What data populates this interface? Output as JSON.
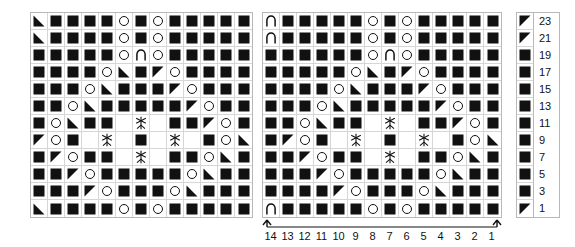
{
  "legend_icons": {
    "knit": "filled-square-icon",
    "yarnover": "open-circle-icon",
    "dec_left": "left-leaning-triangle-icon",
    "dec_right": "right-leaning-triangle-icon",
    "arch": "arch-icon",
    "cluster": "cluster-star-icon",
    "blank": "empty-cell"
  },
  "colors": {
    "symbol": "#111111",
    "grid_line": "#d6d6d6",
    "border": "#b8b8b8",
    "background": "#ffffff"
  },
  "row_numbers": [
    "23",
    "21",
    "19",
    "17",
    "15",
    "13",
    "11",
    "9",
    "7",
    "5",
    "3",
    "1"
  ],
  "row_legend_symbols": [
    "dec_left",
    "dec_left",
    "knit",
    "knit",
    "knit",
    "knit",
    "knit",
    "knit",
    "knit",
    "knit",
    "knit",
    "dec_left"
  ],
  "column_numbers": [
    "14",
    "13",
    "12",
    "11",
    "10",
    "9",
    "8",
    "7",
    "6",
    "5",
    "4",
    "3",
    "2",
    "1"
  ],
  "repeat_bracket": {
    "label": "",
    "left_arrow": "up-arrow-icon",
    "right_arrow": "up-arrow-icon"
  },
  "left_chart": {
    "name": "left pattern repeat",
    "columns": 13,
    "rows": [
      [
        "dec_right",
        "knit",
        "knit",
        "knit",
        "knit",
        "yarnover",
        "knit",
        "yarnover",
        "knit",
        "knit",
        "knit",
        "knit",
        "knit"
      ],
      [
        "dec_right",
        "knit",
        "knit",
        "knit",
        "knit",
        "yarnover",
        "knit",
        "yarnover",
        "knit",
        "knit",
        "knit",
        "knit",
        "knit"
      ],
      [
        "knit",
        "knit",
        "knit",
        "knit",
        "knit",
        "yarnover",
        "arch",
        "yarnover",
        "knit",
        "knit",
        "knit",
        "knit",
        "knit"
      ],
      [
        "knit",
        "knit",
        "knit",
        "knit",
        "yarnover",
        "dec_right",
        "knit",
        "dec_left",
        "yarnover",
        "knit",
        "knit",
        "knit",
        "knit"
      ],
      [
        "knit",
        "knit",
        "knit",
        "yarnover",
        "dec_right",
        "knit",
        "knit",
        "knit",
        "dec_left",
        "yarnover",
        "knit",
        "knit",
        "knit"
      ],
      [
        "knit",
        "knit",
        "yarnover",
        "dec_right",
        "knit",
        "knit",
        "knit",
        "knit",
        "knit",
        "dec_left",
        "yarnover",
        "knit",
        "knit"
      ],
      [
        "knit",
        "yarnover",
        "dec_right",
        "knit",
        "knit",
        "blank",
        "cluster",
        "blank",
        "knit",
        "knit",
        "dec_left",
        "yarnover",
        "knit"
      ],
      [
        "dec_left",
        "yarnover",
        "knit",
        "blank",
        "cluster",
        "blank",
        "knit",
        "blank",
        "cluster",
        "blank",
        "knit",
        "yarnover",
        "dec_right"
      ],
      [
        "knit",
        "dec_left",
        "yarnover",
        "knit",
        "knit",
        "blank",
        "cluster",
        "blank",
        "knit",
        "knit",
        "yarnover",
        "dec_right",
        "knit"
      ],
      [
        "knit",
        "knit",
        "dec_left",
        "yarnover",
        "knit",
        "knit",
        "knit",
        "knit",
        "knit",
        "yarnover",
        "dec_right",
        "knit",
        "knit"
      ],
      [
        "knit",
        "knit",
        "knit",
        "dec_left",
        "yarnover",
        "knit",
        "knit",
        "knit",
        "yarnover",
        "dec_right",
        "knit",
        "knit",
        "knit"
      ],
      [
        "dec_right",
        "knit",
        "knit",
        "knit",
        "knit",
        "yarnover",
        "knit",
        "yarnover",
        "knit",
        "knit",
        "knit",
        "knit",
        "knit"
      ]
    ]
  },
  "right_chart": {
    "name": "right pattern repeat",
    "columns": 14,
    "rows": [
      [
        "arch",
        "knit",
        "knit",
        "knit",
        "knit",
        "knit",
        "yarnover",
        "knit",
        "yarnover",
        "knit",
        "knit",
        "knit",
        "knit",
        "knit"
      ],
      [
        "arch",
        "knit",
        "knit",
        "knit",
        "knit",
        "knit",
        "yarnover",
        "knit",
        "yarnover",
        "knit",
        "knit",
        "knit",
        "knit",
        "knit"
      ],
      [
        "knit",
        "knit",
        "knit",
        "knit",
        "knit",
        "knit",
        "yarnover",
        "arch",
        "yarnover",
        "knit",
        "knit",
        "knit",
        "knit",
        "knit"
      ],
      [
        "knit",
        "knit",
        "knit",
        "knit",
        "knit",
        "yarnover",
        "dec_right",
        "knit",
        "dec_left",
        "yarnover",
        "knit",
        "knit",
        "knit",
        "knit"
      ],
      [
        "knit",
        "knit",
        "knit",
        "knit",
        "yarnover",
        "dec_right",
        "knit",
        "knit",
        "knit",
        "dec_left",
        "yarnover",
        "knit",
        "knit",
        "knit"
      ],
      [
        "knit",
        "knit",
        "knit",
        "yarnover",
        "dec_right",
        "knit",
        "knit",
        "knit",
        "knit",
        "knit",
        "dec_left",
        "yarnover",
        "knit",
        "knit"
      ],
      [
        "knit",
        "knit",
        "yarnover",
        "dec_right",
        "knit",
        "knit",
        "blank",
        "cluster",
        "blank",
        "knit",
        "knit",
        "dec_left",
        "yarnover",
        "knit"
      ],
      [
        "knit",
        "dec_left",
        "yarnover",
        "knit",
        "blank",
        "cluster",
        "blank",
        "knit",
        "blank",
        "cluster",
        "blank",
        "knit",
        "yarnover",
        "dec_right"
      ],
      [
        "knit",
        "knit",
        "dec_left",
        "yarnover",
        "knit",
        "knit",
        "blank",
        "cluster",
        "blank",
        "knit",
        "knit",
        "yarnover",
        "dec_right",
        "knit"
      ],
      [
        "knit",
        "knit",
        "knit",
        "dec_left",
        "yarnover",
        "knit",
        "knit",
        "knit",
        "knit",
        "knit",
        "yarnover",
        "dec_right",
        "knit",
        "knit"
      ],
      [
        "knit",
        "knit",
        "knit",
        "knit",
        "dec_left",
        "yarnover",
        "knit",
        "knit",
        "knit",
        "yarnover",
        "dec_right",
        "knit",
        "knit",
        "knit"
      ],
      [
        "arch",
        "knit",
        "knit",
        "knit",
        "knit",
        "knit",
        "yarnover",
        "knit",
        "yarnover",
        "knit",
        "knit",
        "knit",
        "knit",
        "knit"
      ]
    ]
  }
}
